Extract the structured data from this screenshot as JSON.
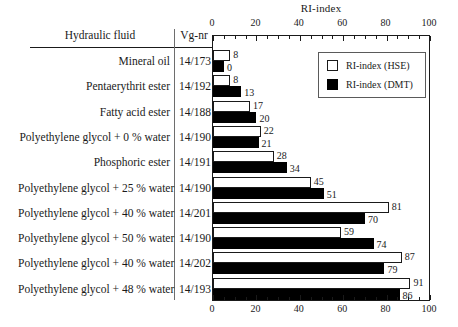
{
  "chart_data": {
    "type": "bar",
    "orientation": "horizontal",
    "title": "RI-index",
    "xlabel": "",
    "ylabel": "",
    "xlim": [
      0,
      100
    ],
    "xticks": [
      0,
      20,
      40,
      60,
      80,
      100
    ],
    "minor_tick_step": 5,
    "grid": false,
    "legend_position": "upper right inside plot",
    "categories": [
      "Mineral oil",
      "Pentaerythrit ester",
      "Fatty acid ester",
      "Polyethylene glycol + 0 % water",
      "Phosphoric ester",
      "Polyethylene glycol + 25 % water",
      "Polyethylene glycol + 40 % water",
      "Polyethylene glycol + 50 % water",
      "Polyethylene glycol + 40 % water",
      "Polyethylene glycol + 48 % water"
    ],
    "series": [
      {
        "name": "RI-index (HSE)",
        "color": "#ffffff",
        "values": [
          8,
          8,
          17,
          22,
          28,
          45,
          81,
          59,
          87,
          91
        ]
      },
      {
        "name": "RI-index (DMT)",
        "color": "#000000",
        "values": [
          0,
          13,
          20,
          21,
          34,
          51,
          70,
          74,
          79,
          86
        ]
      }
    ]
  },
  "table": {
    "headers": {
      "fluid": "Hydraulic fluid",
      "vgnr": "Vg-nr"
    },
    "rows": [
      {
        "fluid": "Mineral oil",
        "vgnr": "14/173",
        "hse": 8,
        "dmt": 0
      },
      {
        "fluid": "Pentaerythrit ester",
        "vgnr": "14/192",
        "hse": 8,
        "dmt": 13
      },
      {
        "fluid": "Fatty acid ester",
        "vgnr": "14/188",
        "hse": 17,
        "dmt": 20
      },
      {
        "fluid": "Polyethylene glycol + 0 % water",
        "vgnr": "14/190",
        "hse": 22,
        "dmt": 21
      },
      {
        "fluid": "Phosphoric ester",
        "vgnr": "14/191",
        "hse": 28,
        "dmt": 34
      },
      {
        "fluid": "Polyethylene glycol + 25 % water",
        "vgnr": "14/190",
        "hse": 45,
        "dmt": 51
      },
      {
        "fluid": "Polyethylene glycol + 40 % water",
        "vgnr": "14/201",
        "hse": 81,
        "dmt": 70
      },
      {
        "fluid": "Polyethylene glycol + 50 % water",
        "vgnr": "14/190",
        "hse": 59,
        "dmt": 74
      },
      {
        "fluid": "Polyethylene glycol + 40 % water",
        "vgnr": "14/202",
        "hse": 87,
        "dmt": 79
      },
      {
        "fluid": "Polyethylene glycol + 48 % water",
        "vgnr": "14/193",
        "hse": 91,
        "dmt": 86
      }
    ]
  },
  "legend": {
    "items": [
      {
        "label": "RI-index (HSE)",
        "swatch": "white"
      },
      {
        "label": "RI-index (DMT)",
        "swatch": "black"
      }
    ]
  },
  "axis": {
    "top_labels": [
      "0",
      "20",
      "40",
      "60",
      "80",
      "100"
    ],
    "bottom_labels": [
      "0",
      "20",
      "40",
      "60",
      "80",
      "100"
    ]
  }
}
